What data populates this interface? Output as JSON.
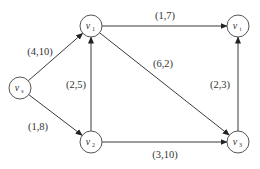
{
  "diagram": {
    "type": "flow-network",
    "nodes": [
      {
        "id": "vs",
        "base": "v",
        "sub": "s"
      },
      {
        "id": "v1",
        "base": "v",
        "sub": "1"
      },
      {
        "id": "vt",
        "base": "v",
        "sub": "t"
      },
      {
        "id": "v2",
        "base": "v",
        "sub": "2"
      },
      {
        "id": "v3",
        "base": "v",
        "sub": "3"
      }
    ],
    "edges": [
      {
        "from": "vs",
        "to": "v1",
        "label": "(4,10)"
      },
      {
        "from": "v1",
        "to": "vt",
        "label": "(1,7)"
      },
      {
        "from": "v1",
        "to": "v3",
        "label": "(6,2)"
      },
      {
        "from": "v2",
        "to": "v1",
        "label": "(2,5)"
      },
      {
        "from": "vs",
        "to": "v2",
        "label": "(1,8)"
      },
      {
        "from": "v3",
        "to": "vt",
        "label": "(2,3)"
      },
      {
        "from": "v2",
        "to": "v3",
        "label": "(3,10)"
      }
    ]
  }
}
